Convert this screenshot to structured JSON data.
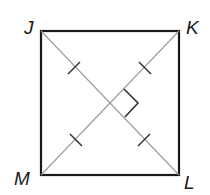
{
  "diagram": {
    "type": "square with diagonals",
    "vertices": [
      {
        "name": "J",
        "position": "top-left"
      },
      {
        "name": "K",
        "position": "top-right"
      },
      {
        "name": "L",
        "position": "bottom-right"
      },
      {
        "name": "M",
        "position": "bottom-left"
      }
    ],
    "diagonals": [
      "JL",
      "KM"
    ],
    "marks": {
      "congruent_tick_marks": 4,
      "right_angle_marker": "at diagonal intersection, right side"
    },
    "colors": {
      "outline": "#1a1a1a",
      "diagonal": "#9a9a9a"
    }
  }
}
